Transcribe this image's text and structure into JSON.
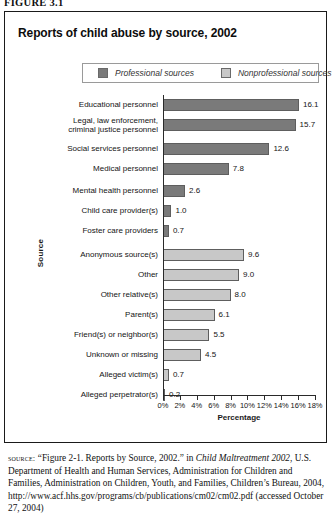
{
  "figure": {
    "label": "FIGURE 3.1"
  },
  "chart_data": {
    "type": "bar",
    "orientation": "horizontal",
    "title": "Reports of child abuse by source, 2002",
    "xlabel": "Percentage",
    "ylabel": "Source",
    "xlim": [
      0,
      18
    ],
    "grid": false,
    "legend_position": "top",
    "legend": [
      {
        "label": "Professional sources",
        "color": "#7a7a7a"
      },
      {
        "label": "Nonprofessional sources",
        "color": "#c8c8c8"
      }
    ],
    "tick_labels": [
      "0%",
      "2%",
      "4%",
      "6%",
      "8%",
      "10%",
      "12%",
      "14%",
      "16%",
      "18%"
    ],
    "tick_values": [
      0,
      2,
      4,
      6,
      8,
      10,
      12,
      14,
      16,
      18
    ],
    "categories": [
      "Educational personnel",
      "Legal, law enforcement,\ncriminal justice personnel",
      "Social services personnel",
      "Medical personnel",
      "Mental health personnel",
      "Child care provider(s)",
      "Foster care providers",
      "Anonymous source(s)",
      "Other",
      "Other relative(s)",
      "Parent(s)",
      "Friend(s) or neighbor(s)",
      "Unknown or missing",
      "Alleged victim(s)",
      "Alleged perpetrator(s)"
    ],
    "values": [
      16.1,
      15.7,
      12.6,
      7.8,
      2.6,
      1.0,
      0.7,
      9.6,
      9.0,
      8.0,
      6.1,
      5.5,
      4.5,
      0.7,
      0.2
    ],
    "value_labels": [
      "16.1",
      "15.7",
      "12.6",
      "7.8",
      "2.6",
      "1.0",
      "0.7",
      "9.6",
      "9.0",
      "8.0",
      "6.1",
      "5.5",
      "4.5",
      "0.7",
      "0.2"
    ],
    "series_of": [
      "professional",
      "professional",
      "professional",
      "professional",
      "professional",
      "professional",
      "professional",
      "nonprofessional",
      "nonprofessional",
      "nonprofessional",
      "nonprofessional",
      "nonprofessional",
      "nonprofessional",
      "nonprofessional",
      "nonprofessional"
    ]
  },
  "source": {
    "kicker": "source:",
    "text_1": " “Figure 2-1. Reports by Source, 2002.” in ",
    "italic_1": "Child Maltreatment 2002",
    "text_2": ", U.S. Department of Health and Human Services, Administration for Children and Families, Administration on Children, Youth, and Families, Children’s Bureau, 2004, http://www.acf.hhs.gov/programs/cb/publications/cm02/cm02.pdf (accessed October 27, 2004)"
  }
}
